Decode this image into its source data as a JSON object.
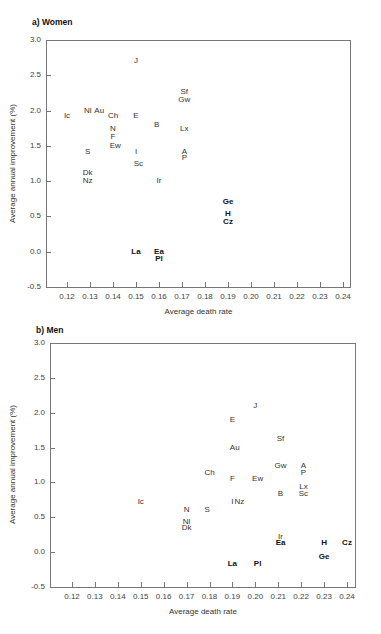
{
  "chart_data": [
    {
      "type": "scatter",
      "title": "a) Women",
      "xlabel": "Average death rate",
      "ylabel": "Average annual improvement (%)",
      "xlim": [
        0.11,
        0.245
      ],
      "ylim": [
        -0.5,
        3.0
      ],
      "xticks": [
        "0.12",
        "0.13",
        "0.14",
        "0.15",
        "0.16",
        "0.17",
        "0.18",
        "0.19",
        "0.20",
        "0.21",
        "0.22",
        "0.23",
        "0.24"
      ],
      "yticks": [
        "3.0",
        "2.5",
        "2.0",
        "1.5",
        "1.0",
        "0.5",
        "0.0",
        "-0.5"
      ],
      "grid": false,
      "points": [
        {
          "label": "J",
          "x": 0.15,
          "y": 2.7,
          "bold": false
        },
        {
          "label": "Sf",
          "x": 0.171,
          "y": 2.26,
          "bold": false
        },
        {
          "label": "Gw",
          "x": 0.171,
          "y": 2.15,
          "bold": false
        },
        {
          "label": "Ic",
          "x": 0.12,
          "y": 1.93,
          "bold": false
        },
        {
          "label": "Nl",
          "x": 0.129,
          "y": 2.0,
          "bold": false
        },
        {
          "label": "Au",
          "x": 0.134,
          "y": 2.0,
          "bold": false
        },
        {
          "label": "Ch",
          "x": 0.14,
          "y": 1.93,
          "bold": false
        },
        {
          "label": "E",
          "x": 0.15,
          "y": 1.93,
          "bold": false
        },
        {
          "label": "B",
          "x": 0.159,
          "y": 1.8,
          "bold": false
        },
        {
          "label": "Lx",
          "x": 0.171,
          "y": 1.74,
          "bold": false
        },
        {
          "label": "N",
          "x": 0.14,
          "y": 1.74,
          "bold": false
        },
        {
          "label": "F",
          "x": 0.14,
          "y": 1.62,
          "bold": false
        },
        {
          "label": "Ew",
          "x": 0.141,
          "y": 1.5,
          "bold": false
        },
        {
          "label": "S",
          "x": 0.129,
          "y": 1.42,
          "bold": false
        },
        {
          "label": "I",
          "x": 0.15,
          "y": 1.42,
          "bold": false
        },
        {
          "label": "A",
          "x": 0.171,
          "y": 1.42,
          "bold": false
        },
        {
          "label": "P",
          "x": 0.171,
          "y": 1.33,
          "bold": false
        },
        {
          "label": "Sc",
          "x": 0.151,
          "y": 1.24,
          "bold": false
        },
        {
          "label": "Dk",
          "x": 0.129,
          "y": 1.12,
          "bold": false
        },
        {
          "label": "Nz",
          "x": 0.129,
          "y": 1.0,
          "bold": false
        },
        {
          "label": "Ir",
          "x": 0.16,
          "y": 1.0,
          "bold": false
        },
        {
          "label": "Ge",
          "x": 0.19,
          "y": 0.7,
          "bold": true
        },
        {
          "label": "H",
          "x": 0.19,
          "y": 0.53,
          "bold": true
        },
        {
          "label": "Cz",
          "x": 0.19,
          "y": 0.42,
          "bold": true
        },
        {
          "label": "La",
          "x": 0.15,
          "y": 0.0,
          "bold": true
        },
        {
          "label": "Ea",
          "x": 0.16,
          "y": 0.0,
          "bold": true
        },
        {
          "label": "Pl",
          "x": 0.16,
          "y": -0.1,
          "bold": true
        }
      ]
    },
    {
      "type": "scatter",
      "title": "b) Men",
      "xlabel": "Average death rate",
      "ylabel": "Average annual improvement (%)",
      "xlim": [
        0.11,
        0.245
      ],
      "ylim": [
        -0.5,
        3.0
      ],
      "xticks": [
        "0.12",
        "0.13",
        "0.14",
        "0.15",
        "0.16",
        "0.17",
        "0.18",
        "0.19",
        "0.20",
        "0.21",
        "0.22",
        "0.23",
        "0.24"
      ],
      "yticks": [
        "3.0",
        "2.5",
        "2.0",
        "1.5",
        "1.0",
        "0.5",
        "0.0",
        "-0.5"
      ],
      "grid": false,
      "points": [
        {
          "label": "J",
          "x": 0.2,
          "y": 2.1,
          "bold": false
        },
        {
          "label": "E",
          "x": 0.19,
          "y": 1.9,
          "bold": false
        },
        {
          "label": "Sf",
          "x": 0.211,
          "y": 1.62,
          "bold": false
        },
        {
          "label": "Au",
          "x": 0.191,
          "y": 1.5,
          "bold": false
        },
        {
          "label": "Gw",
          "x": 0.211,
          "y": 1.24,
          "bold": false
        },
        {
          "label": "A",
          "x": 0.221,
          "y": 1.24,
          "bold": false
        },
        {
          "label": "P",
          "x": 0.221,
          "y": 1.14,
          "bold": false
        },
        {
          "label": "Ch",
          "x": 0.18,
          "y": 1.14,
          "bold": false
        },
        {
          "label": "F",
          "x": 0.19,
          "y": 1.05,
          "bold": false
        },
        {
          "label": "Ew",
          "x": 0.201,
          "y": 1.05,
          "bold": false
        },
        {
          "label": "Lx",
          "x": 0.221,
          "y": 0.93,
          "bold": false
        },
        {
          "label": "Sc",
          "x": 0.221,
          "y": 0.84,
          "bold": false
        },
        {
          "label": "B",
          "x": 0.211,
          "y": 0.84,
          "bold": false
        },
        {
          "label": "Ic",
          "x": 0.15,
          "y": 0.72,
          "bold": false
        },
        {
          "label": "I",
          "x": 0.19,
          "y": 0.72,
          "bold": false
        },
        {
          "label": "Nz",
          "x": 0.193,
          "y": 0.72,
          "bold": false
        },
        {
          "label": "N",
          "x": 0.17,
          "y": 0.6,
          "bold": false
        },
        {
          "label": "S",
          "x": 0.179,
          "y": 0.6,
          "bold": false
        },
        {
          "label": "Nl",
          "x": 0.17,
          "y": 0.43,
          "bold": false
        },
        {
          "label": "Dk",
          "x": 0.17,
          "y": 0.34,
          "bold": false
        },
        {
          "label": "Ir",
          "x": 0.211,
          "y": 0.22,
          "bold": false
        },
        {
          "label": "Ea",
          "x": 0.211,
          "y": 0.13,
          "bold": true
        },
        {
          "label": "H",
          "x": 0.23,
          "y": 0.13,
          "bold": true
        },
        {
          "label": "Cz",
          "x": 0.24,
          "y": 0.13,
          "bold": true
        },
        {
          "label": "Ge",
          "x": 0.23,
          "y": -0.07,
          "bold": true
        },
        {
          "label": "La",
          "x": 0.19,
          "y": -0.17,
          "bold": true
        },
        {
          "label": "Pl",
          "x": 0.201,
          "y": -0.17,
          "bold": true
        }
      ]
    }
  ]
}
